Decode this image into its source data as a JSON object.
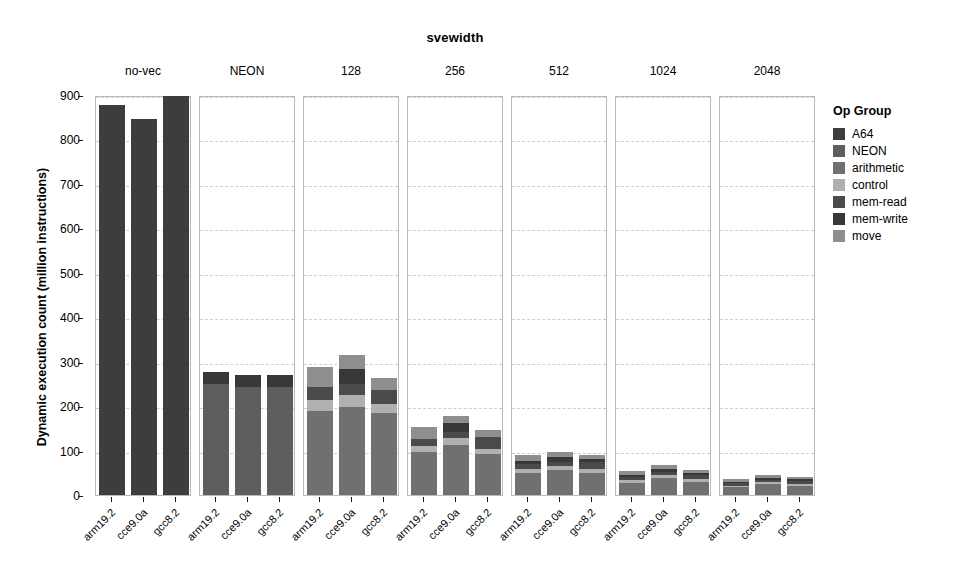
{
  "chart_data": {
    "type": "bar",
    "subtype": "stacked-bar-faceted",
    "title": "svewidth",
    "xlabel": "",
    "ylabel": "Dynamic execution count (million instructions)",
    "ylim": [
      0,
      900
    ],
    "yticks": [
      0,
      100,
      200,
      300,
      400,
      500,
      600,
      700,
      800,
      900
    ],
    "grid": true,
    "legend_title": "Op Group",
    "legend_position": "right",
    "facet_variable": "svewidth",
    "facets": [
      "no-vec",
      "NEON",
      "128",
      "256",
      "512",
      "1024",
      "2048"
    ],
    "categories": [
      "arm19.2",
      "cce9.0a",
      "gcc8.2"
    ],
    "op_groups": [
      "A64",
      "NEON",
      "arithmetic",
      "control",
      "mem-read",
      "mem-write",
      "move"
    ],
    "colors": {
      "A64": "#3d3d3d",
      "NEON": "#5e5e5e",
      "arithmetic": "#707070",
      "control": "#b0b0b0",
      "mem-read": "#4a4a4a",
      "mem-write": "#383838",
      "move": "#8e8e8e"
    },
    "panels": [
      {
        "label": "no-vec",
        "bars": [
          {
            "category": "arm19.2",
            "total": 877,
            "segments": {
              "A64": 877,
              "NEON": 0,
              "arithmetic": 0,
              "control": 0,
              "mem-read": 0,
              "mem-write": 0,
              "move": 0
            }
          },
          {
            "category": "cce9.0a",
            "total": 845,
            "segments": {
              "A64": 845,
              "NEON": 0,
              "arithmetic": 0,
              "control": 0,
              "mem-read": 0,
              "mem-write": 0,
              "move": 0
            }
          },
          {
            "category": "gcc8.2",
            "total": 897,
            "segments": {
              "A64": 897,
              "NEON": 0,
              "arithmetic": 0,
              "control": 0,
              "mem-read": 0,
              "mem-write": 0,
              "move": 0
            }
          }
        ]
      },
      {
        "label": "NEON",
        "bars": [
          {
            "category": "arm19.2",
            "total": 277,
            "segments": {
              "A64": 0,
              "NEON": 250,
              "arithmetic": 0,
              "control": 0,
              "mem-read": 0,
              "mem-write": 27,
              "move": 0
            }
          },
          {
            "category": "cce9.0a",
            "total": 271,
            "segments": {
              "A64": 0,
              "NEON": 243,
              "arithmetic": 0,
              "control": 0,
              "mem-read": 0,
              "mem-write": 28,
              "move": 0
            }
          },
          {
            "category": "gcc8.2",
            "total": 269,
            "segments": {
              "A64": 0,
              "NEON": 243,
              "arithmetic": 0,
              "control": 0,
              "mem-read": 0,
              "mem-write": 26,
              "move": 0
            }
          }
        ]
      },
      {
        "label": "128",
        "bars": [
          {
            "category": "arm19.2",
            "total": 288,
            "segments": {
              "A64": 0,
              "NEON": 0,
              "arithmetic": 188,
              "control": 25,
              "mem-read": 30,
              "mem-write": 0,
              "move": 45
            }
          },
          {
            "category": "cce9.0a",
            "total": 314,
            "segments": {
              "A64": 0,
              "NEON": 0,
              "arithmetic": 197,
              "control": 28,
              "mem-read": 25,
              "mem-write": 34,
              "move": 30
            }
          },
          {
            "category": "gcc8.2",
            "total": 263,
            "segments": {
              "A64": 0,
              "NEON": 0,
              "arithmetic": 184,
              "control": 20,
              "mem-read": 33,
              "mem-write": 0,
              "move": 26
            }
          }
        ]
      },
      {
        "label": "256",
        "bars": [
          {
            "category": "arm19.2",
            "total": 152,
            "segments": {
              "A64": 0,
              "NEON": 0,
              "arithmetic": 96,
              "control": 14,
              "mem-read": 17,
              "mem-write": 0,
              "move": 25
            }
          },
          {
            "category": "cce9.0a",
            "total": 178,
            "segments": {
              "A64": 0,
              "NEON": 0,
              "arithmetic": 112,
              "control": 16,
              "mem-read": 14,
              "mem-write": 19,
              "move": 17
            }
          },
          {
            "category": "gcc8.2",
            "total": 146,
            "segments": {
              "A64": 0,
              "NEON": 0,
              "arithmetic": 92,
              "control": 12,
              "mem-read": 27,
              "mem-write": 0,
              "move": 15
            }
          }
        ]
      },
      {
        "label": "512",
        "bars": [
          {
            "category": "arm19.2",
            "total": 90,
            "segments": {
              "A64": 0,
              "NEON": 0,
              "arithmetic": 50,
              "control": 8,
              "mem-read": 12,
              "mem-write": 6,
              "move": 14
            }
          },
          {
            "category": "cce9.0a",
            "total": 97,
            "segments": {
              "A64": 0,
              "NEON": 0,
              "arithmetic": 56,
              "control": 9,
              "mem-read": 10,
              "mem-write": 11,
              "move": 11
            }
          },
          {
            "category": "gcc8.2",
            "total": 90,
            "segments": {
              "A64": 0,
              "NEON": 0,
              "arithmetic": 50,
              "control": 8,
              "mem-read": 16,
              "mem-write": 6,
              "move": 10
            }
          }
        ]
      },
      {
        "label": "1024",
        "bars": [
          {
            "category": "arm19.2",
            "total": 54,
            "segments": {
              "A64": 0,
              "NEON": 0,
              "arithmetic": 28,
              "control": 5,
              "mem-read": 8,
              "mem-write": 4,
              "move": 9
            }
          },
          {
            "category": "cce9.0a",
            "total": 68,
            "segments": {
              "A64": 0,
              "NEON": 0,
              "arithmetic": 38,
              "control": 6,
              "mem-read": 7,
              "mem-write": 8,
              "move": 9
            }
          },
          {
            "category": "gcc8.2",
            "total": 57,
            "segments": {
              "A64": 0,
              "NEON": 0,
              "arithmetic": 30,
              "control": 5,
              "mem-read": 11,
              "mem-write": 4,
              "move": 7
            }
          }
        ]
      },
      {
        "label": "2048",
        "bars": [
          {
            "category": "arm19.2",
            "total": 36,
            "segments": {
              "A64": 0,
              "NEON": 0,
              "arithmetic": 18,
              "control": 3,
              "mem-read": 6,
              "mem-write": 3,
              "move": 6
            }
          },
          {
            "category": "cce9.0a",
            "total": 46,
            "segments": {
              "A64": 0,
              "NEON": 0,
              "arithmetic": 25,
              "control": 4,
              "mem-read": 5,
              "mem-write": 5,
              "move": 7
            }
          },
          {
            "category": "gcc8.2",
            "total": 41,
            "segments": {
              "A64": 0,
              "NEON": 0,
              "arithmetic": 20,
              "control": 4,
              "mem-read": 8,
              "mem-write": 3,
              "move": 6
            }
          }
        ]
      }
    ]
  },
  "legend": {
    "title": "Op Group",
    "items": [
      {
        "label": "A64",
        "color": "#3d3d3d"
      },
      {
        "label": "NEON",
        "color": "#5e5e5e"
      },
      {
        "label": "arithmetic",
        "color": "#707070"
      },
      {
        "label": "control",
        "color": "#b0b0b0"
      },
      {
        "label": "mem-read",
        "color": "#4a4a4a"
      },
      {
        "label": "mem-write",
        "color": "#383838"
      },
      {
        "label": "move",
        "color": "#8e8e8e"
      }
    ]
  }
}
